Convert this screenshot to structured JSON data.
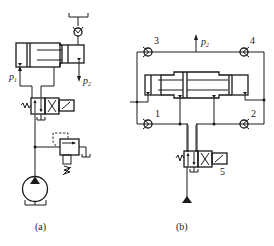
{
  "figure": {
    "type": "hydraulic-circuit-schematic",
    "stroke_color": "#1a1a1a",
    "background": "#ffffff"
  },
  "diagram_a": {
    "caption": "(a)",
    "labels": {
      "p1": {
        "main": "p",
        "sub": "1"
      },
      "p2": {
        "main": "p",
        "sub": "2"
      }
    },
    "components": [
      "tank-top",
      "check-valve",
      "double-acting-booster-cylinder",
      "4-way-2-position-solenoid-valve",
      "relief-valve",
      "hydraulic-pump",
      "tank-bottom"
    ]
  },
  "diagram_b": {
    "caption": "(b)",
    "labels": {
      "p2": {
        "main": "p",
        "sub": "2"
      },
      "check_valves": [
        "1",
        "2",
        "3",
        "4"
      ],
      "valve_number": "5"
    },
    "components": [
      "check-valve-1",
      "check-valve-2",
      "check-valve-3",
      "check-valve-4",
      "double-acting-booster-cylinder",
      "directional-valve-5",
      "pressure-supply"
    ]
  }
}
